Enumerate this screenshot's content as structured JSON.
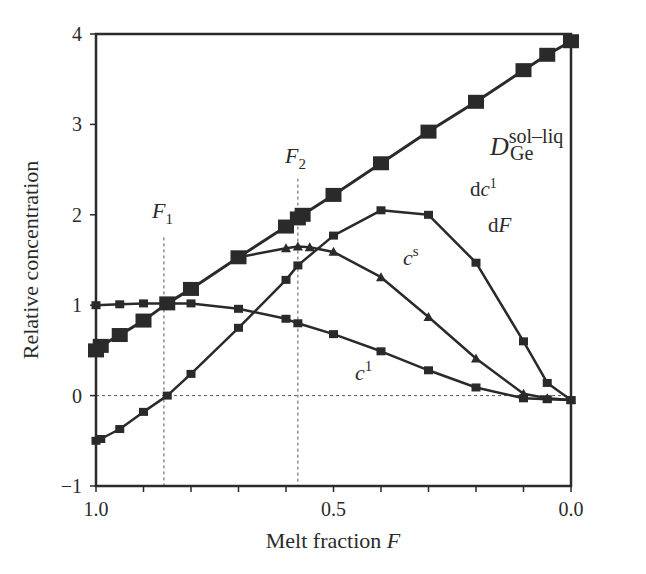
{
  "chart_data": {
    "type": "line",
    "title": "",
    "xlabel": "Melt fraction F",
    "ylabel": "Relative concentration",
    "xlim": [
      1.0,
      0.0
    ],
    "ylim": [
      -1,
      4
    ],
    "x_reversed": true,
    "xticks": [
      1.0,
      0.9,
      0.8,
      0.7,
      0.6,
      0.5,
      0.4,
      0.3,
      0.2,
      0.1,
      0.0
    ],
    "xtick_labels": [
      {
        "v": 1.0,
        "label": "1.0"
      },
      {
        "v": 0.5,
        "label": "0.5"
      },
      {
        "v": 0.0,
        "label": "0.0"
      }
    ],
    "yticks": [
      {
        "v": 4,
        "label": "4"
      },
      {
        "v": 3,
        "label": "3"
      },
      {
        "v": 2,
        "label": "2"
      },
      {
        "v": 1,
        "label": "1"
      },
      {
        "v": 0,
        "label": "0"
      },
      {
        "v": -1,
        "label": "−1"
      }
    ],
    "grid": false,
    "reference_lines": [
      {
        "type": "horizontal",
        "y": 0,
        "style": "dashed"
      },
      {
        "type": "vertical",
        "x": 0.857,
        "label": "F1",
        "style": "dashed"
      },
      {
        "type": "vertical",
        "x": 0.575,
        "label": "F2",
        "style": "dashed"
      }
    ],
    "series": [
      {
        "name": "D_Ge^sol-liq",
        "marker": "large-square",
        "x": [
          1.0,
          0.99,
          0.95,
          0.9,
          0.85,
          0.8,
          0.7,
          0.6,
          0.575,
          0.565,
          0.5,
          0.4,
          0.3,
          0.2,
          0.1,
          0.05,
          0.0
        ],
        "values": [
          0.5,
          0.55,
          0.67,
          0.83,
          1.02,
          1.18,
          1.53,
          1.87,
          1.96,
          2.0,
          2.22,
          2.57,
          2.92,
          3.25,
          3.6,
          3.77,
          3.92
        ]
      },
      {
        "name": "c^l",
        "marker": "small-square",
        "x": [
          1.0,
          0.95,
          0.9,
          0.85,
          0.8,
          0.7,
          0.6,
          0.575,
          0.5,
          0.4,
          0.3,
          0.2,
          0.1,
          0.05,
          0.0
        ],
        "values": [
          1.0,
          1.01,
          1.02,
          1.02,
          1.02,
          0.96,
          0.85,
          0.8,
          0.68,
          0.49,
          0.28,
          0.09,
          -0.03,
          -0.04,
          -0.05
        ]
      },
      {
        "name": "dc^l/dF",
        "marker": "small-square",
        "x": [
          1.0,
          0.99,
          0.95,
          0.9,
          0.85,
          0.8,
          0.7,
          0.6,
          0.575,
          0.5,
          0.4,
          0.3,
          0.2,
          0.1,
          0.05,
          0.0
        ],
        "values": [
          -0.5,
          -0.48,
          -0.37,
          -0.18,
          0.0,
          0.24,
          0.75,
          1.28,
          1.44,
          1.77,
          2.05,
          2.0,
          1.47,
          0.6,
          0.14,
          -0.05
        ]
      },
      {
        "name": "c^s",
        "marker": "triangle",
        "x": [
          0.7,
          0.6,
          0.575,
          0.55,
          0.5,
          0.4,
          0.3,
          0.2,
          0.1,
          0.05,
          0.0
        ],
        "values": [
          1.53,
          1.63,
          1.65,
          1.64,
          1.59,
          1.31,
          0.87,
          0.41,
          0.02,
          -0.03,
          -0.05
        ]
      }
    ],
    "annotations": [
      {
        "text": "F1",
        "x": 0.83,
        "y": 1.95
      },
      {
        "text": "F2",
        "x": 0.57,
        "y": 2.6
      },
      {
        "text": "D_Ge^sol-liq",
        "x": 0.2,
        "y": 2.55
      },
      {
        "text": "dc^l / dF",
        "x": 0.27,
        "y": 2.05
      },
      {
        "text": "c^s",
        "x": 0.38,
        "y": 1.42
      },
      {
        "text": "c^l",
        "x": 0.48,
        "y": 0.28
      }
    ]
  },
  "labels": {
    "xlabel_main": "Melt fraction ",
    "xlabel_var": "F",
    "ylabel": "Relative concentration",
    "F": "F",
    "sub1": "1",
    "sub2": "2",
    "D": "D",
    "D_sup": "sol–liq",
    "D_sub": "Ge",
    "dc_d": "d",
    "dc_c": "c",
    "dc_sup": "1",
    "dF_d": "d",
    "dF_F": "F",
    "cs_c": "c",
    "cs_sup": "s",
    "cl_c": "c",
    "cl_sup": "1"
  }
}
